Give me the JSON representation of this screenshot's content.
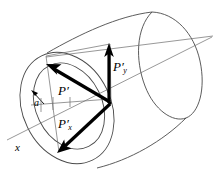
{
  "figure": {
    "kind": "vector-decomposition-on-cylinder",
    "background_color": "#ffffff",
    "stroke_color": "#000000",
    "thin_stroke_color": "#555555",
    "labels": {
      "resultant": "P",
      "resultant_prime": "′",
      "x_component_base": "P",
      "x_component_sub": "x",
      "y_component_base": "P",
      "y_component_sub": "y",
      "angle": "a",
      "axis": "x"
    },
    "label_full_text": {
      "resultant": "P′",
      "x_component": "P′x",
      "y_component": "P′y",
      "angle": "a",
      "axis": "x"
    }
  }
}
